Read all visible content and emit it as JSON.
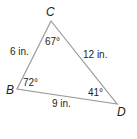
{
  "diagram": {
    "type": "triangle",
    "vertices": [
      {
        "name": "C",
        "x": 51,
        "y": 21
      },
      {
        "name": "B",
        "x": 17,
        "y": 89
      },
      {
        "name": "D",
        "x": 117,
        "y": 104
      }
    ],
    "angles": {
      "C": "67°",
      "B": "72°",
      "D": "41°"
    },
    "sides": {
      "BC": "6 in.",
      "CD": "12 in.",
      "BD": "9 in."
    },
    "line_color": "#9a9a9a",
    "text_color": "#231f20"
  }
}
